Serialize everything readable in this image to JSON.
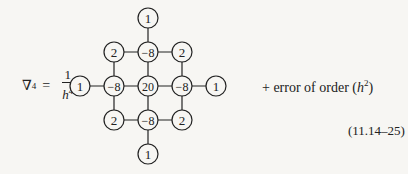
{
  "equation": {
    "lhs_symbol": "∇",
    "lhs_power": "4",
    "equals": "=",
    "fraction_numerator": "1",
    "fraction_denominator_base": "h",
    "fraction_denominator_power": "4",
    "rhs_prefix": "+ error of order (",
    "rhs_var": "h",
    "rhs_power": "2",
    "rhs_suffix": ")",
    "number": "(11.14–25)"
  },
  "stencil": {
    "grid_spacing_px": 34,
    "nodes": [
      {
        "row": 0,
        "col": 2,
        "value": "1"
      },
      {
        "row": 1,
        "col": 1,
        "value": "2"
      },
      {
        "row": 1,
        "col": 2,
        "value": "−8"
      },
      {
        "row": 1,
        "col": 3,
        "value": "2"
      },
      {
        "row": 2,
        "col": 0,
        "value": "1"
      },
      {
        "row": 2,
        "col": 1,
        "value": "−8"
      },
      {
        "row": 2,
        "col": 2,
        "value": "20"
      },
      {
        "row": 2,
        "col": 3,
        "value": "−8"
      },
      {
        "row": 2,
        "col": 4,
        "value": "1"
      },
      {
        "row": 3,
        "col": 1,
        "value": "2"
      },
      {
        "row": 3,
        "col": 2,
        "value": "−8"
      },
      {
        "row": 3,
        "col": 3,
        "value": "2"
      },
      {
        "row": 4,
        "col": 2,
        "value": "1"
      }
    ]
  }
}
